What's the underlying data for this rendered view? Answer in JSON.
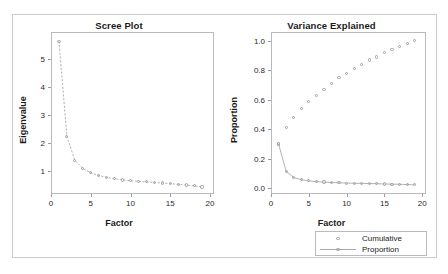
{
  "caption": {
    "text": "",
    "visible_fragment": ""
  },
  "figure": {
    "background": "#ffffff",
    "frame_color": "#c9c9cf",
    "marker_color": "#9d9da6",
    "line_color": "#a9a9b2",
    "text_color": "#1b1b1b"
  },
  "legend": {
    "position": "below-right-panel",
    "entries": [
      {
        "label": "Cumulative",
        "marker": "open-circle",
        "line": false
      },
      {
        "label": "Proportion",
        "marker": "open-circle",
        "line": true
      }
    ]
  },
  "chart_data": [
    {
      "type": "line",
      "title": "Scree Plot",
      "xlabel": "Factor",
      "ylabel": "Eigenvalue",
      "xlim": [
        0,
        20.5
      ],
      "ylim": [
        0.2,
        5.95
      ],
      "xticks": [
        0,
        5,
        10,
        15,
        20
      ],
      "yticks": [
        1,
        2,
        3,
        4,
        5
      ],
      "xtick_labels": [
        "0",
        "5",
        "10",
        "15",
        "20"
      ],
      "ytick_labels": [
        "1",
        "2",
        "3",
        "4",
        "5"
      ],
      "grid": false,
      "legend_position": "none",
      "marker": "open-circle",
      "linestyle": "dashed",
      "x": [
        1,
        2,
        3,
        4,
        5,
        6,
        7,
        8,
        9,
        10,
        11,
        12,
        13,
        14,
        15,
        16,
        17,
        18,
        19
      ],
      "values": [
        5.62,
        2.24,
        1.39,
        1.11,
        0.95,
        0.86,
        0.79,
        0.74,
        0.7,
        0.67,
        0.65,
        0.63,
        0.61,
        0.59,
        0.57,
        0.54,
        0.52,
        0.49,
        0.45
      ],
      "series": [
        {
          "name": "Eigenvalue",
          "values": [
            5.62,
            2.24,
            1.39,
            1.11,
            0.95,
            0.86,
            0.79,
            0.74,
            0.7,
            0.67,
            0.65,
            0.63,
            0.61,
            0.59,
            0.57,
            0.54,
            0.52,
            0.49,
            0.45
          ]
        }
      ]
    },
    {
      "type": "scatter",
      "title": "Variance Explained",
      "xlabel": "Factor",
      "ylabel": "Proportion",
      "xlim": [
        0,
        20.5
      ],
      "ylim": [
        -0.04,
        1.06
      ],
      "xticks": [
        0,
        5,
        10,
        15,
        20
      ],
      "yticks": [
        0.0,
        0.2,
        0.4,
        0.6,
        0.8,
        1.0
      ],
      "xtick_labels": [
        "0",
        "5",
        "10",
        "15",
        "20"
      ],
      "ytick_labels": [
        "0.0",
        "0.2",
        "0.4",
        "0.6",
        "0.8",
        "1.0"
      ],
      "grid": false,
      "legend_position": "below",
      "x": [
        1,
        2,
        3,
        4,
        5,
        6,
        7,
        8,
        9,
        10,
        11,
        12,
        13,
        14,
        15,
        16,
        17,
        18,
        19
      ],
      "series": [
        {
          "name": "Cumulative",
          "marker": "open-circle",
          "linestyle": "none",
          "values": [
            0.3,
            0.41,
            0.48,
            0.54,
            0.59,
            0.63,
            0.67,
            0.71,
            0.75,
            0.78,
            0.81,
            0.84,
            0.87,
            0.89,
            0.92,
            0.94,
            0.96,
            0.98,
            1.0
          ]
        },
        {
          "name": "Proportion",
          "marker": "open-circle",
          "linestyle": "solid",
          "values": [
            0.3,
            0.115,
            0.072,
            0.057,
            0.049,
            0.044,
            0.041,
            0.038,
            0.036,
            0.034,
            0.033,
            0.032,
            0.031,
            0.03,
            0.028,
            0.027,
            0.026,
            0.024,
            0.022
          ]
        }
      ]
    }
  ]
}
